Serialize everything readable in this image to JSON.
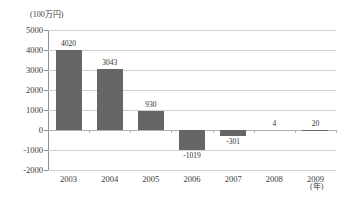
{
  "chart_data": {
    "type": "bar",
    "title": "",
    "subtitle": "",
    "xlabel": "(年)",
    "ylabel": "(100万円)",
    "categories": [
      "2003",
      "2004",
      "2005",
      "2006",
      "2007",
      "2008",
      "2009"
    ],
    "values": [
      4020,
      3043,
      930,
      -1019,
      -301,
      4,
      20
    ],
    "value_labels": [
      "4020",
      "3043",
      "930",
      "-1019",
      "-301",
      "4",
      "20"
    ],
    "series": [
      {
        "name": "",
        "values": [
          4020,
          3043,
          930,
          -1019,
          -301,
          4,
          20
        ]
      }
    ],
    "ylim": [
      -2000,
      5000
    ],
    "ytick_step": 1000,
    "ytick_labels": [
      "5000",
      "4000",
      "3000",
      "2000",
      "1000",
      "0",
      "-1000",
      "-2000"
    ],
    "ytick_values": [
      5000,
      4000,
      3000,
      2000,
      1000,
      0,
      -1000,
      -2000
    ],
    "grid": true,
    "legend": false,
    "legend_position": "none",
    "bar_color": "#666666",
    "gridline_color": "#cfcfcf",
    "axis_color": "#8e8e8e",
    "background_color": "#ffffff",
    "text_color": "#3a3a3a"
  }
}
